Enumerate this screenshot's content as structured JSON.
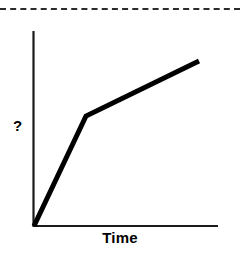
{
  "figure": {
    "top_rule": {
      "name": "dashed-rule",
      "style": "dashed",
      "color": "#2b2b2b"
    },
    "y_axis_label": "?",
    "x_axis_label": "Time",
    "axis_color": "#1a1a1a",
    "curve_color": "#000000",
    "background": "#ffffff"
  },
  "chart_data": {
    "type": "line",
    "title": "",
    "xlabel": "Time",
    "ylabel": "?",
    "grid": false,
    "legend": null,
    "axis_style": "two-axis-lines-no-ticks",
    "xlim": [
      0,
      1
    ],
    "ylim": [
      0,
      1
    ],
    "annotations": [],
    "series": [
      {
        "name": "unknown-quantity-over-time",
        "shape": "two-segment-piecewise-linear-concave",
        "x": [
          0.0,
          0.283,
          0.897
        ],
        "y": [
          0.0,
          0.564,
          0.846
        ],
        "points_px": [
          {
            "x": 34,
            "y": 226
          },
          {
            "x": 86,
            "y": 116
          },
          {
            "x": 199,
            "y": 61
          }
        ],
        "segments": [
          {
            "from": "origin",
            "to": "knee",
            "description": "steep rapid rise"
          },
          {
            "from": "knee",
            "to": "end",
            "description": "shallower continued rise"
          }
        ]
      }
    ]
  }
}
